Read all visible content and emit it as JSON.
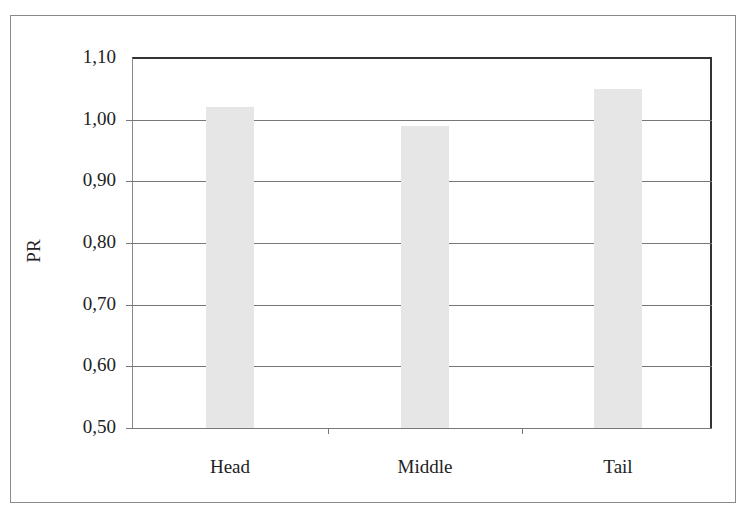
{
  "chart_data": {
    "type": "bar",
    "title": "",
    "xlabel": "",
    "ylabel": "PR",
    "categories": [
      "Head",
      "Middle",
      "Tail"
    ],
    "values": [
      1.02,
      0.99,
      1.05
    ],
    "ylim": [
      0.5,
      1.1
    ],
    "yticks": [
      "0,50",
      "0,60",
      "0,70",
      "0,80",
      "0,90",
      "1,00",
      "1,10"
    ],
    "grid": true,
    "legend": "none",
    "bar_color": "#e6e6e6"
  }
}
